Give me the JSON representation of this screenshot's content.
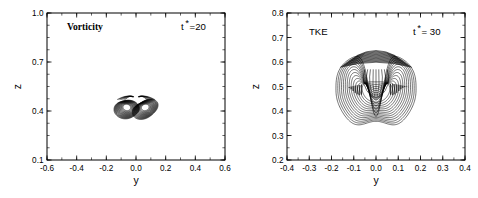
{
  "figure": {
    "type": "contour-figure",
    "panel_count": 2
  },
  "chart_data": [
    {
      "type": "line",
      "panel": "left",
      "title": "Vorticity",
      "annotation": "t*=20",
      "annotation_base": "t",
      "annotation_sup": "*",
      "annotation_rest": "=20",
      "xlabel": "y",
      "ylabel": "z",
      "xlim": [
        -0.6,
        0.6
      ],
      "ylim": [
        0.1,
        1.0
      ],
      "xticks": [
        -0.6,
        -0.4,
        -0.2,
        0.0,
        0.2,
        0.4,
        0.6
      ],
      "xticklabels": [
        "-0.6",
        "-0.4",
        "-0.2",
        "0.0",
        "0.2",
        "0.4",
        "0.6"
      ],
      "yticks": [
        0.1,
        0.4,
        0.7,
        1.0
      ],
      "yticklabels": [
        "0.1",
        "0.4",
        "0.7",
        "1.0"
      ],
      "xminor_step": 0.1,
      "yminor_step": 0.075,
      "grid": false,
      "legend": "none",
      "description": "Counter-rotating vortex pair; dense nested vorticity contours forming two dark lobes with light cores",
      "feature": "vortex-pair",
      "structures": [
        {
          "name": "left-vortex",
          "center_y": -0.062,
          "center_z": 0.415,
          "core_y": -0.062,
          "core_z": 0.423,
          "rings": 16,
          "outer_ry": 0.085,
          "outer_rz": 0.062,
          "inner_ry": 0.018,
          "inner_rz": 0.014,
          "rotation_deg": -12
        },
        {
          "name": "right-vortex",
          "center_y": 0.062,
          "center_z": 0.415,
          "core_y": 0.062,
          "core_z": 0.423,
          "rings": 16,
          "outer_ry": 0.085,
          "outer_rz": 0.062,
          "inner_ry": 0.018,
          "inner_rz": 0.014,
          "rotation_deg": 12
        }
      ],
      "plume_tails": [
        {
          "name": "left-tail",
          "tip_y": -0.04,
          "tip_z": 0.48
        },
        {
          "name": "right-tail",
          "tip_y": 0.04,
          "tip_z": 0.48
        }
      ]
    },
    {
      "type": "line",
      "panel": "right",
      "title": "TKE",
      "annotation": "t* = 30",
      "annotation_base": "t",
      "annotation_sup": "*",
      "annotation_rest": "= 30",
      "xlabel": "y",
      "ylabel": "z",
      "xlim": [
        -0.4,
        0.4
      ],
      "ylim": [
        0.2,
        0.8
      ],
      "xticks": [
        -0.4,
        -0.3,
        -0.2,
        -0.1,
        0.0,
        0.1,
        0.2,
        0.3,
        0.4
      ],
      "xticklabels": [
        "-0.4",
        "-0.3",
        "-0.2",
        "-0.1",
        "0.0",
        "0.1",
        "0.2",
        "0.3",
        "0.4"
      ],
      "yticks": [
        0.2,
        0.3,
        0.4,
        0.5,
        0.6,
        0.7,
        0.8
      ],
      "yticklabels": [
        "0.2",
        "0.3",
        "0.4",
        "0.5",
        "0.6",
        "0.7",
        "0.8"
      ],
      "xminor_step": 0.05,
      "yminor_step": 0.05,
      "grid": false,
      "legend": "none",
      "description": "Mushroom-shaped turbulent kinetic energy blob; nested closed contours dense along the upper cap with a central downward cusp and scalloped lower contours",
      "feature": "tke-dome",
      "dome": {
        "center_y": 0.0,
        "outer_top_z": 0.64,
        "outer_bottom_z": 0.34,
        "outer_half_width": 0.18,
        "levels": 14,
        "cap_band_top_z": 0.638,
        "cap_band_bottom_z": 0.59,
        "cusp_tip_z": 0.445,
        "cusp_top_z": 0.57,
        "cusp_half_width": 0.04,
        "scallop_amplitude": 0.018,
        "scallop_bottom_z": 0.355
      }
    }
  ]
}
